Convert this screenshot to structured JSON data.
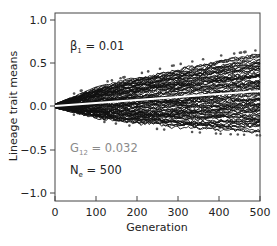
{
  "chart_data": {
    "type": "line",
    "title": "",
    "xlabel": "Generation",
    "ylabel": "Lineage trait means",
    "xlim": [
      0,
      500
    ],
    "ylim": [
      -1.0,
      1.0
    ],
    "x_ticks": [
      "0",
      "100",
      "200",
      "300",
      "400",
      "500"
    ],
    "y_ticks": [
      "1.0",
      "0.5",
      "0.0",
      "-0.5",
      "-1.0"
    ],
    "grid": false,
    "legend": null,
    "annotations": [
      {
        "label": "β",
        "sub": "1",
        "value": " = 0.01",
        "color": "#222222"
      },
      {
        "label": "G",
        "sub": "12",
        "value": " = 0.032",
        "color": "#8a8a8a"
      },
      {
        "label": "N",
        "sub": "e",
        "value": " = 500",
        "color": "#222222"
      }
    ],
    "series": [
      {
        "name": "lineages (many stochastic trajectories)",
        "color": "#111111",
        "x": [
          0,
          100,
          200,
          300,
          400,
          500
        ],
        "upper_envelope": [
          0.02,
          0.22,
          0.34,
          0.45,
          0.55,
          0.62
        ],
        "lower_envelope": [
          -0.02,
          -0.15,
          -0.22,
          -0.27,
          -0.3,
          -0.32
        ]
      },
      {
        "name": "expected mean",
        "color": "#ffffff",
        "x": [
          0,
          500
        ],
        "values": [
          0.0,
          0.17
        ]
      }
    ]
  },
  "labels": {
    "ylabel": "Lineage trait means",
    "xlabel": "Generation",
    "x_ticks": [
      "0",
      "100",
      "200",
      "300",
      "400",
      "500"
    ],
    "y_ticks": [
      "1.0",
      "0.5",
      "0.0",
      "−0.5",
      "−1.0"
    ],
    "beta": {
      "sym": "β",
      "sub": "1",
      "val": " = 0.01"
    },
    "g12": {
      "sym": "G",
      "sub": "12",
      "val": " = 0.032"
    },
    "ne": {
      "sym": "N",
      "sub": "e",
      "val": " = 500"
    }
  }
}
